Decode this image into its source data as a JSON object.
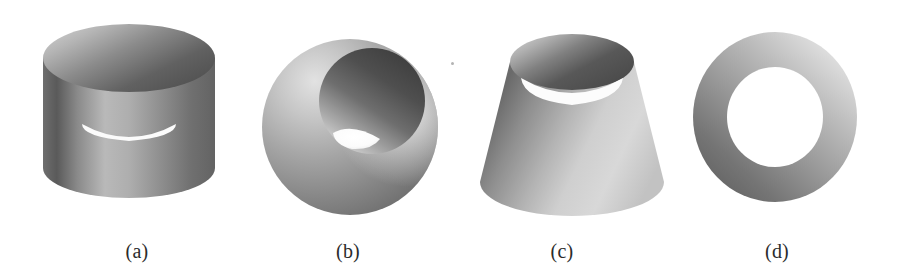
{
  "plate": {
    "background_color": "#ffffff",
    "width": 901,
    "height": 280,
    "description": "Grayscale rendered plate of four shaded surfaces of revolution"
  },
  "panels": [
    {
      "id": "a",
      "caption": "(a)",
      "shape_name": "open-cylinder",
      "shape_label": "Cylinder",
      "caption_center_x": 137,
      "caption_y": 240,
      "box": {
        "x": 36,
        "y": 16,
        "width": 186,
        "height": 212
      },
      "geometry": {
        "outer_radius_x": 86,
        "top_ellipse_ry": 34,
        "bottom_ellipse_ry": 30,
        "body_height": 120,
        "inner_radius_x": 70,
        "inner_ellipse_ry": 28
      },
      "shading": {
        "outer_light_hex": "#d2d2d2",
        "outer_mid_hex": "#9a9a9a",
        "outer_dark_hex": "#5d5d5d",
        "inner_light_hex": "#cccccc",
        "inner_dark_hex": "#4a4a4a",
        "highlight_angle_deg": 250
      }
    },
    {
      "id": "b",
      "caption": "(b)",
      "shape_name": "bored-sphere",
      "shape_label": "Sphere with cylindrical bore",
      "caption_center_x": 348,
      "caption_y": 240,
      "box": {
        "x": 256,
        "y": 28,
        "width": 188,
        "height": 198
      },
      "geometry": {
        "sphere_radius": 88,
        "sphere_center_x": 350,
        "sphere_center_y": 127,
        "bore_radius": 52,
        "bore_center_x": 372,
        "bore_center_y": 101,
        "aperture_width": 36,
        "aperture_height": 18
      },
      "shading": {
        "sphere_light_hex": "#d8d8d8",
        "sphere_mid_hex": "#a3a3a3",
        "sphere_dark_hex": "#676767",
        "cavity_dark_hex": "#4e4e4e",
        "cavity_light_hex": "#c2c2c2",
        "aperture_hex": "#fdfdfd"
      }
    },
    {
      "id": "c",
      "caption": "(c)",
      "shape_name": "truncated-cone",
      "shape_label": "Cone frustum",
      "caption_center_x": 562,
      "caption_y": 240,
      "box": {
        "x": 474,
        "y": 22,
        "width": 194,
        "height": 208
      },
      "geometry": {
        "top_radius_x": 62,
        "top_ellipse_ry": 28,
        "base_radius_x": 92,
        "base_ellipse_ry": 34,
        "body_height": 120,
        "top_center_x": 572,
        "top_center_y": 62,
        "base_center_y": 182
      },
      "shading": {
        "outer_light_hex": "#dcdcdc",
        "outer_mid_hex": "#a0a0a0",
        "outer_dark_hex": "#626262",
        "inner_light_hex": "#c8c8c8",
        "inner_dark_hex": "#4b4b4b"
      }
    },
    {
      "id": "d",
      "caption": "(d)",
      "shape_name": "flat-annulus",
      "shape_label": "Annulus",
      "caption_center_x": 777,
      "caption_y": 240,
      "box": {
        "x": 688,
        "y": 28,
        "width": 174,
        "height": 178
      },
      "geometry": {
        "center_x": 775,
        "center_y": 117,
        "outer_radius_x": 82,
        "outer_radius_y": 85,
        "inner_radius_x": 48,
        "inner_radius_y": 50
      },
      "shading": {
        "light_hex": "#e4e4e4",
        "mid_hex": "#a8a8a8",
        "dark_hex": "#5a5a5a",
        "gradient_from": "top-right",
        "gradient_to": "bottom-left"
      }
    }
  ],
  "artifacts": {
    "speck": {
      "x": 451,
      "y": 62,
      "label": "scan-speck"
    }
  }
}
